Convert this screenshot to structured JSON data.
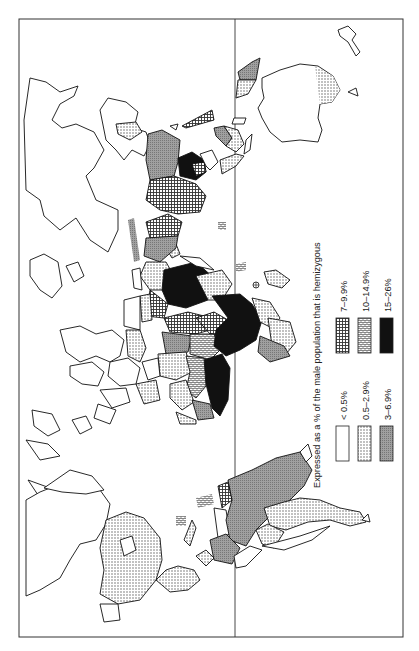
{
  "map": {
    "orientation": "rotated 90 degrees counter-clockwise",
    "title": "Expressed as a % of the male population that is hemizygous",
    "has_equator_line": true
  },
  "legend": {
    "title": "Expressed as a % of the male population that is hemizygous",
    "items": [
      {
        "label": "< 0.5%",
        "pattern": "white"
      },
      {
        "label": "0.5–2.9%",
        "pattern": "fine-dots"
      },
      {
        "label": "3–6.9%",
        "pattern": "grey"
      },
      {
        "label": "7–9.9%",
        "pattern": "grid"
      },
      {
        "label": "10–14.9%",
        "pattern": "bricks"
      },
      {
        "label": "15–26%",
        "pattern": "black"
      }
    ]
  },
  "colors": {
    "outline": "#111111",
    "grey_fill": "#9a9a9a",
    "black_fill": "#111111",
    "background": "#ffffff"
  }
}
